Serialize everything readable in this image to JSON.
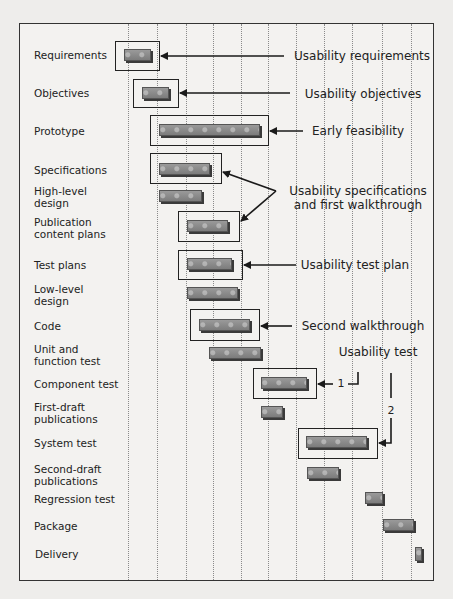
{
  "diagram": {
    "type": "gantt-timeline",
    "grid_columns": 11,
    "colors": {
      "bar": "#8a8a8a",
      "bar_shadow": "#3a3a3a",
      "frame": "#333333",
      "background": "#f3f2f0",
      "gridline": "#8a8a8a"
    },
    "tasks": [
      {
        "label": "Requirements",
        "highlighted": true
      },
      {
        "label": "Objectives",
        "highlighted": true
      },
      {
        "label": "Prototype",
        "highlighted": true
      },
      {
        "label": "Specifications",
        "highlighted": true
      },
      {
        "label": "High-level\ndesign",
        "highlighted": false
      },
      {
        "label": "Publication\ncontent plans",
        "highlighted": true
      },
      {
        "label": "Test plans",
        "highlighted": true
      },
      {
        "label": "Low-level\ndesign",
        "highlighted": false
      },
      {
        "label": "Code",
        "highlighted": true
      },
      {
        "label": "Unit and\nfunction test",
        "highlighted": false
      },
      {
        "label": "Component test",
        "highlighted": true
      },
      {
        "label": "First-draft\npublications",
        "highlighted": false
      },
      {
        "label": "System test",
        "highlighted": true
      },
      {
        "label": "Second-draft\npublications",
        "highlighted": false
      },
      {
        "label": "Regression test",
        "highlighted": false
      },
      {
        "label": "Package",
        "highlighted": false
      },
      {
        "label": "Delivery",
        "highlighted": false
      }
    ],
    "annotations": [
      {
        "text": "Usability requirements",
        "targets": [
          "Requirements"
        ]
      },
      {
        "text": "Usability objectives",
        "targets": [
          "Objectives"
        ]
      },
      {
        "text": "Early feasibility",
        "targets": [
          "Prototype"
        ]
      },
      {
        "text": "Usability specifications\nand first walkthrough",
        "targets": [
          "Specifications",
          "Publication content plans"
        ]
      },
      {
        "text": "Usability test plan",
        "targets": [
          "Test plans"
        ]
      },
      {
        "text": "Second walkthrough",
        "targets": [
          "Code"
        ]
      },
      {
        "text": "Usability test",
        "targets": [
          "Component test",
          "System test"
        ]
      }
    ],
    "usability_test_markers": {
      "first": "1",
      "second": "2"
    }
  }
}
